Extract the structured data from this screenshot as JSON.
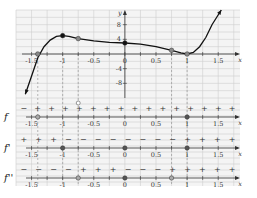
{
  "chart_data": {
    "type": "line",
    "title": "",
    "xlabel": "x",
    "ylabel": "y",
    "xlim": [
      -1.75,
      1.85
    ],
    "ylim": [
      -12,
      12
    ],
    "x_ticks": [
      "-1.5",
      "-1",
      "-0.5",
      "0",
      "0.5",
      "1",
      "1.5"
    ],
    "x_tick_values": [
      -1.5,
      -1,
      -0.5,
      0,
      0.5,
      1,
      1.5
    ],
    "y_ticks": [
      "8",
      "4",
      "-4",
      "-8"
    ],
    "y_tick_values": [
      8,
      4,
      -4,
      -8
    ],
    "grid": true,
    "series": [
      {
        "name": "f",
        "x": [
          -1.6,
          -1.5,
          -1.4,
          -1.3,
          -1.2,
          -1.1,
          -1.0,
          -0.9,
          -0.75,
          -0.5,
          -0.25,
          0,
          0.25,
          0.5,
          0.75,
          0.9,
          1.0,
          1.1,
          1.2,
          1.3,
          1.4,
          1.55
        ],
        "y": [
          -11,
          -6,
          -1,
          2,
          3.8,
          4.8,
          5,
          4.8,
          4.2,
          3.6,
          3.2,
          3,
          2.7,
          2.0,
          1.0,
          0.3,
          0,
          0.4,
          2,
          4.5,
          8,
          12
        ]
      }
    ],
    "marked_points": [
      {
        "x": -1.4,
        "y": 0,
        "style": "gray"
      },
      {
        "x": -1,
        "y": 5,
        "style": "filled"
      },
      {
        "x": -0.75,
        "y": 4.2,
        "style": "gray"
      },
      {
        "x": 0,
        "y": 3,
        "style": "filled"
      },
      {
        "x": 0.75,
        "y": 1,
        "style": "gray"
      },
      {
        "x": 1,
        "y": 0,
        "style": "gray"
      }
    ],
    "dashed_guides": [
      -1.4,
      -1,
      -0.75,
      0.75,
      1
    ],
    "sign_charts": [
      {
        "label": "f",
        "signs": [
          "−",
          "+",
          "+",
          "+",
          "+",
          "+",
          "+",
          "+",
          "+",
          "+",
          "+",
          "+",
          "+",
          "+",
          "+",
          "+"
        ],
        "points": [
          {
            "x": -1.4,
            "style": "open"
          },
          {
            "x": 1,
            "style": "filled"
          }
        ],
        "marker_above": {
          "x": -0.75,
          "style": "open"
        }
      },
      {
        "label": "f'",
        "signs": [
          "+",
          "+",
          "+",
          "−",
          "−",
          "−",
          "−",
          "−",
          "−",
          "−",
          "−",
          "+",
          "+",
          "+",
          "+"
        ],
        "points": [
          {
            "x": -1,
            "style": "filled"
          },
          {
            "x": 0,
            "style": "filled"
          },
          {
            "x": 1,
            "style": "filled"
          }
        ]
      },
      {
        "label": "f''",
        "signs": [
          "−",
          "−",
          "−",
          "−",
          "+",
          "+",
          "+",
          "−",
          "−",
          "−",
          "+",
          "+",
          "+",
          "+",
          "+"
        ],
        "points": [
          {
            "x": -0.75,
            "style": "open"
          },
          {
            "x": 0,
            "style": "filled"
          },
          {
            "x": 0.75,
            "style": "open"
          }
        ]
      }
    ]
  }
}
